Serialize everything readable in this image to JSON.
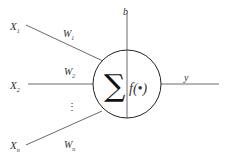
{
  "diagram": {
    "inputs": [
      {
        "label": "X",
        "sub": "1"
      },
      {
        "label": "X",
        "sub": "2"
      },
      {
        "label": "X",
        "sub": "n"
      }
    ],
    "weights": [
      {
        "label": "W",
        "sub": "1"
      },
      {
        "label": "W",
        "sub": "2"
      },
      {
        "label": "W",
        "sub": "n"
      }
    ],
    "ellipsis": "⋮",
    "bias": "b",
    "sum_symbol": "∑",
    "activation": "f(•)",
    "output": "y"
  }
}
